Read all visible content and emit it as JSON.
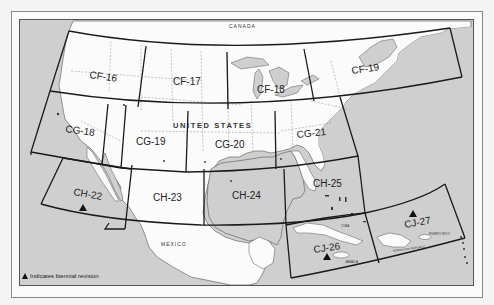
{
  "map": {
    "countries": {
      "canada": "CANADA",
      "united_states": "UNITED STATES",
      "mexico": "MEXICO"
    },
    "charts": [
      {
        "id": "CF-16",
        "biennial": false
      },
      {
        "id": "CF-17",
        "biennial": false
      },
      {
        "id": "CF-18",
        "biennial": false
      },
      {
        "id": "CF-19",
        "biennial": false
      },
      {
        "id": "CG-18",
        "biennial": false
      },
      {
        "id": "CG-19",
        "biennial": false
      },
      {
        "id": "CG-20",
        "biennial": false
      },
      {
        "id": "CG-21",
        "biennial": false
      },
      {
        "id": "CH-22",
        "biennial": true
      },
      {
        "id": "CH-23",
        "biennial": false
      },
      {
        "id": "CH-24",
        "biennial": false
      },
      {
        "id": "CH-25",
        "biennial": false
      },
      {
        "id": "CJ-26",
        "biennial": true
      },
      {
        "id": "CJ-27",
        "biennial": true
      }
    ],
    "places": {
      "cuba": "CUBA",
      "jamaica": "JAMAICA",
      "dominican_republic": "DOMINICAN REPUBLIC",
      "puerto_rico": "PUERTO RICO"
    }
  },
  "legend": {
    "symbol": "triangle-icon",
    "text": "Indicates biennial revision"
  },
  "colors": {
    "water": "#cfcfcf",
    "land": "#fbfbfb",
    "grid_line": "#222222",
    "frame": "#8a8a8a"
  }
}
